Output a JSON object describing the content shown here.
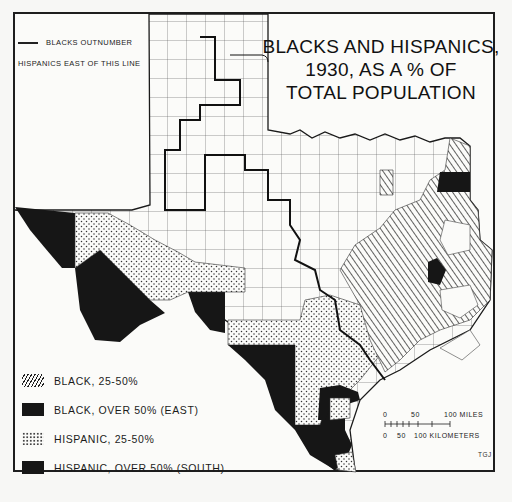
{
  "title": {
    "lines": [
      "BLACKS AND HISPANICS,",
      "1930, AS A % OF",
      "TOTAL POPULATION"
    ]
  },
  "line_legend": {
    "line1": "BLACKS OUTNUMBER",
    "line2": "HISPANICS EAST OF THIS LINE"
  },
  "legend": {
    "items": [
      {
        "label": "BLACK, 25-50%",
        "pattern": "hatch"
      },
      {
        "label": "BLACK, OVER 50% (EAST)",
        "pattern": "solid"
      },
      {
        "label": "HISPANIC, 25-50%",
        "pattern": "dots"
      },
      {
        "label": "HISPANIC, OVER 50% (SOUTH)",
        "pattern": "solid"
      }
    ]
  },
  "scale_bar": {
    "miles_ticks": [
      "0",
      "50",
      "100 MILES"
    ],
    "km_ticks": [
      "0",
      "50",
      "100 KILOMETERS"
    ]
  },
  "credit": "TGJ",
  "colors": {
    "ink": "#161616",
    "paper": "#fbfbf9",
    "background": "#f7f7f5"
  },
  "map": {
    "subject": "Texas counties, 1930",
    "categories": [
      "black_25_50",
      "black_over_50",
      "hispanic_25_50",
      "hispanic_over_50",
      "under_25"
    ]
  }
}
